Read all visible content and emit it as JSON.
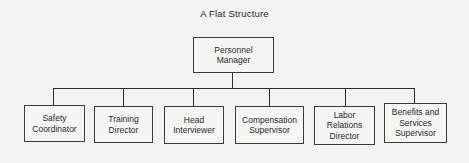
{
  "diagram": {
    "title": "A Flat Structure",
    "root": {
      "label": "Personnel\nManager"
    },
    "children": [
      {
        "label": "Safety\nCoordinator"
      },
      {
        "label": "Training\nDirector"
      },
      {
        "label": "Head\nInterviewer"
      },
      {
        "label": "Compensation\nSupervisor"
      },
      {
        "label": "Labor\nRelations\nDirector"
      },
      {
        "label": "Benefits and\nServices\nSupervisor"
      }
    ],
    "line_color": "#2c2c2c"
  }
}
